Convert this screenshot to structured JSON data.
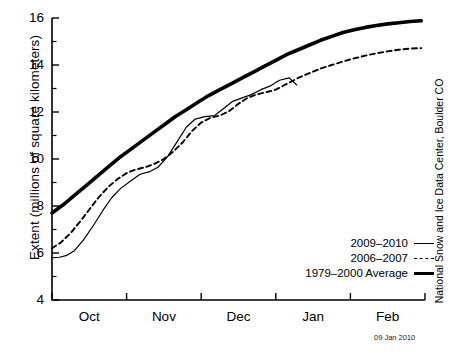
{
  "chart_data": {
    "type": "line",
    "title": "",
    "subtitle": "",
    "xlabel": "",
    "ylabel": "Extent (millions of square kilometers)",
    "ylim": [
      4,
      16
    ],
    "xlim": [
      0,
      5
    ],
    "yticks": [
      4,
      6,
      8,
      10,
      12,
      14,
      16
    ],
    "yticks_minor": [
      5,
      7,
      9,
      11,
      13,
      15
    ],
    "xtick_labels": [
      "Oct",
      "Nov",
      "Dec",
      "Jan",
      "Feb"
    ],
    "xtick_positions": [
      0.5,
      1.5,
      2.5,
      3.5,
      4.5
    ],
    "grid": false,
    "legend_position": "lower right",
    "annotation_date": "09 Jan 2010",
    "credit": "National Snow and Ice Data Center, Boulder CO",
    "series": [
      {
        "name": "2009–2010",
        "style": "solid-thin",
        "x": [
          0.0,
          0.1,
          0.2,
          0.3,
          0.42,
          0.55,
          0.68,
          0.8,
          0.92,
          1.05,
          1.18,
          1.3,
          1.42,
          1.55,
          1.68,
          1.8,
          1.92,
          2.05,
          2.18,
          2.3,
          2.42,
          2.55,
          2.68,
          2.8,
          2.92,
          3.05,
          3.18,
          3.28
        ],
        "y": [
          5.8,
          5.82,
          5.9,
          6.1,
          6.55,
          7.15,
          7.8,
          8.35,
          8.75,
          9.05,
          9.35,
          9.45,
          9.65,
          10.1,
          10.75,
          11.35,
          11.7,
          11.8,
          11.85,
          12.15,
          12.45,
          12.6,
          12.75,
          12.95,
          13.1,
          13.35,
          13.45,
          13.15
        ]
      },
      {
        "name": "2006–2007",
        "style": "dashed",
        "x": [
          0.0,
          0.12,
          0.25,
          0.38,
          0.5,
          0.62,
          0.75,
          0.88,
          1.0,
          1.12,
          1.25,
          1.38,
          1.5,
          1.62,
          1.75,
          1.88,
          2.0,
          2.12,
          2.25,
          2.38,
          2.5,
          2.62,
          2.75,
          2.88,
          3.0,
          3.15,
          3.3,
          3.45,
          3.6,
          3.75,
          3.9,
          4.05,
          4.2,
          4.35,
          4.5,
          4.65,
          4.8,
          4.95
        ],
        "y": [
          6.2,
          6.45,
          6.85,
          7.35,
          7.85,
          8.35,
          8.8,
          9.15,
          9.4,
          9.55,
          9.65,
          9.8,
          10.0,
          10.3,
          10.7,
          11.2,
          11.55,
          11.75,
          11.85,
          12.05,
          12.35,
          12.6,
          12.75,
          12.85,
          12.95,
          13.2,
          13.45,
          13.65,
          13.85,
          14.0,
          14.15,
          14.28,
          14.4,
          14.5,
          14.58,
          14.65,
          14.7,
          14.72
        ]
      },
      {
        "name": "1979–2000 Average",
        "style": "solid-thick",
        "x": [
          0.0,
          0.15,
          0.3,
          0.45,
          0.6,
          0.75,
          0.9,
          1.05,
          1.2,
          1.35,
          1.5,
          1.65,
          1.8,
          1.95,
          2.1,
          2.25,
          2.4,
          2.55,
          2.7,
          2.85,
          3.0,
          3.15,
          3.3,
          3.45,
          3.6,
          3.75,
          3.9,
          4.05,
          4.2,
          4.35,
          4.5,
          4.65,
          4.8,
          4.95
        ],
        "y": [
          7.7,
          8.05,
          8.45,
          8.85,
          9.25,
          9.65,
          10.05,
          10.4,
          10.75,
          11.1,
          11.45,
          11.8,
          12.1,
          12.4,
          12.7,
          12.95,
          13.2,
          13.45,
          13.7,
          13.95,
          14.2,
          14.45,
          14.65,
          14.85,
          15.05,
          15.22,
          15.38,
          15.5,
          15.6,
          15.68,
          15.75,
          15.8,
          15.85,
          15.88
        ]
      }
    ]
  },
  "axis": {
    "y_tick_labels": [
      "16",
      "14",
      "12",
      "10",
      "8",
      "6",
      "4"
    ],
    "x_tick_labels": [
      "Oct",
      "Nov",
      "Dec",
      "Jan",
      "Feb"
    ]
  },
  "legend": {
    "items": [
      {
        "label": "2009–2010",
        "style": "solid-thin"
      },
      {
        "label": "2006–2007",
        "style": "dashed"
      },
      {
        "label": "1979–2000 Average",
        "style": "solid-thick"
      }
    ]
  },
  "labels": {
    "ylabel": "Extent (millions of square kilometers)",
    "credit": "National Snow and Ice Data Center, Boulder CO",
    "datestamp": "09 Jan 2010"
  },
  "colors": {
    "ink": "#000000",
    "background": "#ffffff"
  }
}
